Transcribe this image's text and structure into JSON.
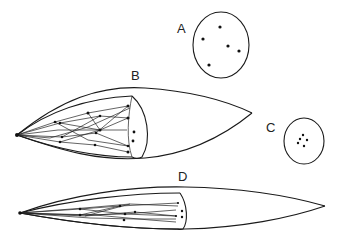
{
  "figure": {
    "panels": [
      {
        "id": "A",
        "label": "A",
        "shape": "circle",
        "dot_count": 5
      },
      {
        "id": "B",
        "label": "B",
        "shape": "lens-with-cutaway-cone"
      },
      {
        "id": "C",
        "label": "C",
        "shape": "circle",
        "dot_count": 5
      },
      {
        "id": "D",
        "label": "D",
        "shape": "elongated-lens-with-cutaway-cone"
      }
    ]
  },
  "colors": {
    "stroke": "#1a1a1a",
    "background": "#ffffff"
  }
}
